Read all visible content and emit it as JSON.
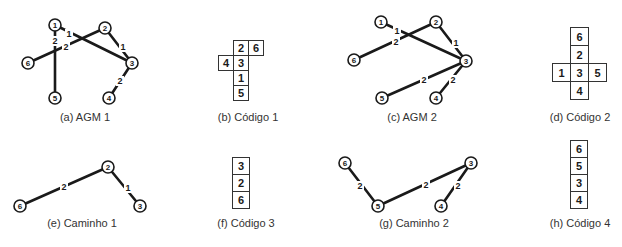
{
  "figures": {
    "agm1": {
      "caption": "(a) AGM 1",
      "nodes": [
        {
          "id": "1",
          "x": 55,
          "y": 25
        },
        {
          "id": "2",
          "x": 105,
          "y": 28
        },
        {
          "id": "3",
          "x": 132,
          "y": 63
        },
        {
          "id": "4",
          "x": 109,
          "y": 98
        },
        {
          "id": "5",
          "x": 55,
          "y": 98
        },
        {
          "id": "6",
          "x": 28,
          "y": 63
        }
      ],
      "edges": [
        {
          "from": "1",
          "to": "3",
          "weight": "1",
          "lx": 69,
          "ly": 34
        },
        {
          "from": "2",
          "to": "3",
          "weight": "1",
          "lx": 123,
          "ly": 47
        },
        {
          "from": "2",
          "to": "6",
          "weight": "2",
          "lx": 66,
          "ly": 47
        },
        {
          "from": "1",
          "to": "5",
          "weight": "2",
          "lx": 55,
          "ly": 41
        },
        {
          "from": "3",
          "to": "4",
          "weight": "2",
          "lx": 120,
          "ly": 81
        }
      ]
    },
    "codigo1": {
      "caption": "(b) Código 1",
      "cells": [
        {
          "value": "2",
          "x": 233,
          "y": 40
        },
        {
          "value": "6",
          "x": 248,
          "y": 40
        },
        {
          "value": "4",
          "x": 218,
          "y": 55
        },
        {
          "value": "3",
          "x": 233,
          "y": 55
        },
        {
          "value": "1",
          "x": 233,
          "y": 70
        },
        {
          "value": "5",
          "x": 233,
          "y": 85
        }
      ],
      "cell_size": 15
    },
    "agm2": {
      "caption": "(c) AGM 2",
      "nodes": [
        {
          "id": "1",
          "x": 381,
          "y": 22
        },
        {
          "id": "2",
          "x": 436,
          "y": 22
        },
        {
          "id": "3",
          "x": 466,
          "y": 61
        },
        {
          "id": "4",
          "x": 436,
          "y": 98
        },
        {
          "id": "5",
          "x": 382,
          "y": 98
        },
        {
          "id": "6",
          "x": 354,
          "y": 60
        }
      ],
      "edges": [
        {
          "from": "1",
          "to": "3",
          "weight": "1",
          "lx": 397,
          "ly": 31
        },
        {
          "from": "2",
          "to": "3",
          "weight": "1",
          "lx": 456,
          "ly": 43
        },
        {
          "from": "2",
          "to": "6",
          "weight": "2",
          "lx": 396,
          "ly": 42
        },
        {
          "from": "3",
          "to": "5",
          "weight": "2",
          "lx": 424,
          "ly": 80
        },
        {
          "from": "3",
          "to": "4",
          "weight": "2",
          "lx": 453,
          "ly": 80
        }
      ]
    },
    "codigo2": {
      "caption": "(d) Código 2",
      "cells": [
        {
          "value": "6",
          "x": 570,
          "y": 27
        },
        {
          "value": "2",
          "x": 570,
          "y": 45
        },
        {
          "value": "1",
          "x": 552,
          "y": 63
        },
        {
          "value": "3",
          "x": 570,
          "y": 63
        },
        {
          "value": "5",
          "x": 588,
          "y": 63
        },
        {
          "value": "4",
          "x": 570,
          "y": 81
        }
      ],
      "cell_size": 18
    },
    "caminho1": {
      "caption": "(e) Caminho 1",
      "nodes": [
        {
          "id": "2",
          "x": 108,
          "y": 167
        },
        {
          "id": "3",
          "x": 140,
          "y": 206
        },
        {
          "id": "6",
          "x": 20,
          "y": 206
        }
      ],
      "edges": [
        {
          "from": "6",
          "to": "2",
          "weight": "2",
          "lx": 64,
          "ly": 187
        },
        {
          "from": "2",
          "to": "3",
          "weight": "1",
          "lx": 128,
          "ly": 188
        }
      ]
    },
    "codigo3": {
      "caption": "(f) Código 3",
      "cells": [
        {
          "value": "3",
          "x": 232,
          "y": 157
        },
        {
          "value": "2",
          "x": 232,
          "y": 174
        },
        {
          "value": "6",
          "x": 232,
          "y": 191
        }
      ],
      "cell_size": 17
    },
    "caminho2": {
      "caption": "(g) Caminho 2",
      "nodes": [
        {
          "id": "6",
          "x": 345,
          "y": 163
        },
        {
          "id": "5",
          "x": 378,
          "y": 206
        },
        {
          "id": "3",
          "x": 471,
          "y": 163
        },
        {
          "id": "4",
          "x": 441,
          "y": 206
        }
      ],
      "edges": [
        {
          "from": "6",
          "to": "5",
          "weight": "2",
          "lx": 360,
          "ly": 186
        },
        {
          "from": "5",
          "to": "3",
          "weight": "2",
          "lx": 426,
          "ly": 185
        },
        {
          "from": "3",
          "to": "4",
          "weight": "2",
          "lx": 458,
          "ly": 186
        }
      ]
    },
    "codigo4": {
      "caption": "(h) Código 4",
      "cells": [
        {
          "value": "6",
          "x": 570,
          "y": 140
        },
        {
          "value": "5",
          "x": 570,
          "y": 157
        },
        {
          "value": "3",
          "x": 570,
          "y": 174
        },
        {
          "value": "4",
          "x": 570,
          "y": 191
        }
      ],
      "cell_size": 17
    }
  },
  "captions": [
    {
      "key": "agm1",
      "x": 85,
      "y": 118
    },
    {
      "key": "codigo1",
      "x": 248,
      "y": 118
    },
    {
      "key": "agm2",
      "x": 412,
      "y": 118
    },
    {
      "key": "codigo2",
      "x": 580,
      "y": 118
    },
    {
      "key": "caminho1",
      "x": 82,
      "y": 224
    },
    {
      "key": "codigo3",
      "x": 246,
      "y": 224
    },
    {
      "key": "caminho2",
      "x": 414,
      "y": 224
    },
    {
      "key": "codigo4",
      "x": 580,
      "y": 224
    }
  ]
}
